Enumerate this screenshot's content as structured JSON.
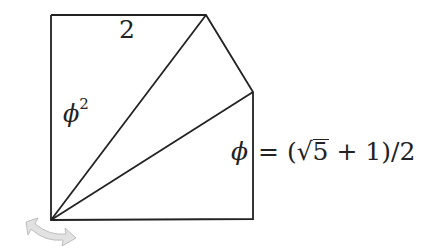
{
  "diagram": {
    "type": "geometric-construction",
    "stroke_color": "#222222",
    "background": "#ffffff",
    "vertices": {
      "top_left": [
        51,
        15
      ],
      "top_apex": [
        206,
        15
      ],
      "right_shoulder": [
        253,
        92
      ],
      "bottom_right": [
        253,
        219
      ],
      "bottom_left": [
        51,
        220
      ]
    },
    "labels": {
      "top_edge": "2",
      "left_edge_symbol": "ϕ",
      "left_edge_exponent": "2",
      "right_edge_symbol": "ϕ",
      "right_edge_equals": "=",
      "right_edge_open": "(",
      "right_edge_sqrt_sign": "√",
      "right_edge_radicand": "5",
      "right_edge_tail": " + 1)/2"
    },
    "rotate_handle": {
      "icon": "rotate-double-arrow-icon",
      "color": "#d0d0d0"
    }
  }
}
